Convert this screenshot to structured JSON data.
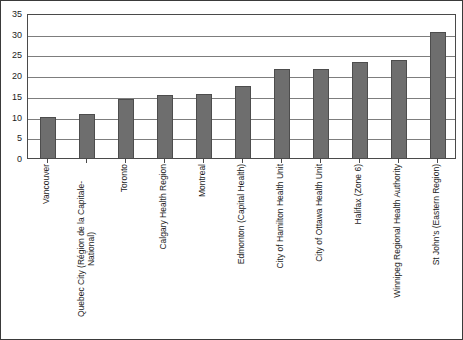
{
  "chart_data": {
    "type": "bar",
    "title": "",
    "subtitle": "",
    "xlabel": "",
    "ylabel": "",
    "ylim": [
      0,
      35
    ],
    "yticks": [
      0,
      5,
      10,
      15,
      20,
      25,
      30,
      35
    ],
    "grid": true,
    "legend": "none",
    "orientation": "vertical",
    "bar_color": "#6e6e6e",
    "bar_edge_color": "#4d4d4d",
    "categories": [
      "Vancouver",
      "Quebec City (Région de la Capitale-National)",
      "Toronto",
      "Calgary Health Region",
      "Montreal",
      "Edmonton (Capital Health)",
      "City of Hamilton Health Unit",
      "City of Ottawa Health Unit",
      "Halifax (Zone 6)",
      "Winnipeg Regional Health Authority",
      "St John's (Eastern Region)"
    ],
    "category_lines": [
      [
        "Vancouver"
      ],
      [
        "Quebec City (Région de la Capitale-",
        "National)"
      ],
      [
        "Toronto"
      ],
      [
        "Calgary Health Region"
      ],
      [
        "Montreal"
      ],
      [
        "Edmonton (Capital Health)"
      ],
      [
        "City of Hamilton Health Unit"
      ],
      [
        "City of Ottawa Health Unit"
      ],
      [
        "Halifax (Zone 6)"
      ],
      [
        "Winnipeg Regional Health Authority"
      ],
      [
        "St John's (Eastern Region)"
      ]
    ],
    "values": [
      9.8,
      10.7,
      14.3,
      15.2,
      15.4,
      17.5,
      21.5,
      21.4,
      23.1,
      23.7,
      30.3
    ]
  },
  "axis": {
    "y_tick_labels": [
      "35",
      "30",
      "25",
      "20",
      "15",
      "10",
      "5",
      "0"
    ]
  }
}
